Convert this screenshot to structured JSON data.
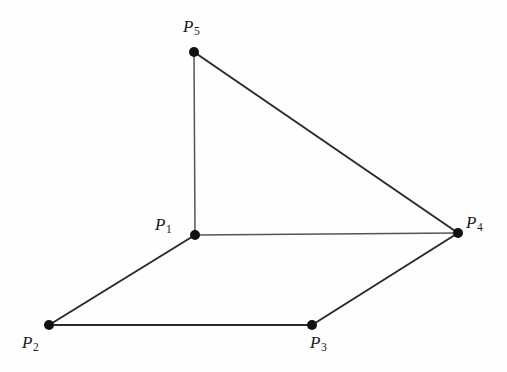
{
  "figure": {
    "background_color": "#fefefe",
    "edge_color": "#2b2b2b",
    "thin_edge_color": "#555555",
    "vertex_color": "#111111",
    "label_color": "#1a1a1a",
    "width": 507,
    "height": 372
  },
  "vertices": [
    {
      "id": "P1",
      "label_p": "P",
      "label_sub": "1",
      "x": 195,
      "y": 235,
      "label_x": 155,
      "label_y": 216,
      "radius": 5
    },
    {
      "id": "P2",
      "label_p": "P",
      "label_sub": "2",
      "x": 49,
      "y": 325,
      "label_x": 22,
      "label_y": 334,
      "radius": 5
    },
    {
      "id": "P3",
      "label_p": "P",
      "label_sub": "3",
      "x": 312,
      "y": 325,
      "label_x": 310,
      "label_y": 334,
      "radius": 5
    },
    {
      "id": "P4",
      "label_p": "P",
      "label_sub": "4",
      "x": 458,
      "y": 233,
      "label_x": 466,
      "label_y": 214,
      "radius": 5
    },
    {
      "id": "P5",
      "label_p": "P",
      "label_sub": "5",
      "x": 194,
      "y": 52,
      "label_x": 183,
      "label_y": 18,
      "radius": 5
    }
  ],
  "edges": [
    {
      "id": "edge-P5-P1",
      "from": "P5",
      "to": "P1",
      "x1": 194,
      "y1": 52,
      "x2": 195,
      "y2": 235,
      "width": 1.5,
      "style": "thin"
    },
    {
      "id": "edge-P5-P4",
      "from": "P5",
      "to": "P4",
      "x1": 194,
      "y1": 52,
      "x2": 458,
      "y2": 233,
      "width": 2.0,
      "style": "solid"
    },
    {
      "id": "edge-P1-P4",
      "from": "P1",
      "to": "P4",
      "x1": 195,
      "y1": 235,
      "x2": 458,
      "y2": 233,
      "width": 1.4,
      "style": "thin"
    },
    {
      "id": "edge-P1-P2",
      "from": "P1",
      "to": "P2",
      "x1": 195,
      "y1": 235,
      "x2": 49,
      "y2": 325,
      "width": 2.0,
      "style": "solid"
    },
    {
      "id": "edge-P2-P3",
      "from": "P2",
      "to": "P3",
      "x1": 49,
      "y1": 325,
      "x2": 312,
      "y2": 325,
      "width": 2.0,
      "style": "solid"
    },
    {
      "id": "edge-P3-P4",
      "from": "P3",
      "to": "P4",
      "x1": 312,
      "y1": 325,
      "x2": 458,
      "y2": 233,
      "width": 2.0,
      "style": "solid"
    }
  ],
  "chart_data": {
    "type": "scatter",
    "title": "",
    "xlabel": "",
    "ylabel": "",
    "point_labels": [
      "P1",
      "P2",
      "P3",
      "P4",
      "P5"
    ],
    "x": [
      195,
      49,
      312,
      458,
      194
    ],
    "y": [
      235,
      325,
      325,
      233,
      52
    ],
    "edge_list": [
      [
        "P5",
        "P1"
      ],
      [
        "P5",
        "P4"
      ],
      [
        "P1",
        "P4"
      ],
      [
        "P1",
        "P2"
      ],
      [
        "P2",
        "P3"
      ],
      [
        "P3",
        "P4"
      ]
    ],
    "grid": false,
    "legend": "none"
  }
}
